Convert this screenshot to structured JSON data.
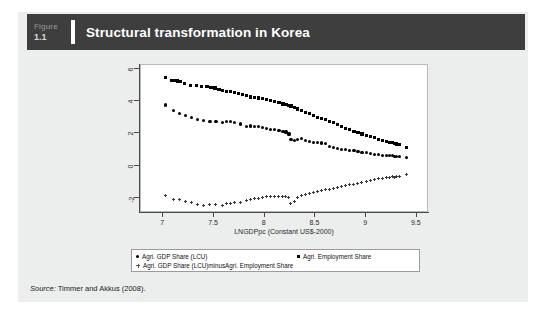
{
  "figure": {
    "label_word": "Figure",
    "number": "1.1",
    "title": "Structural transformation in Korea"
  },
  "source": {
    "prefix": "Source:",
    "text": " Timmer and Akkus (2008)."
  },
  "legend": {
    "items": [
      {
        "marker": "circle",
        "label": "Agri. GDP Share (LCU)"
      },
      {
        "marker": "square",
        "label": "Agri. Employment Share"
      },
      {
        "marker": "plus",
        "label": "Agri. GDP Share (LCU)minusAgri. Employment Share"
      }
    ]
  },
  "chart_data": {
    "type": "scatter",
    "title": "Structural transformation in Korea",
    "xlabel": "LNGDPpc (Constant US$-2000)",
    "ylabel": "",
    "xlim": [
      6.78,
      9.62
    ],
    "ylim": [
      -2.95,
      6.25
    ],
    "xticks": [
      7,
      7.5,
      8,
      8.5,
      9,
      9.5
    ],
    "xtick_labels": [
      "7",
      "7.5",
      "8",
      "8.5",
      "9",
      "9.5"
    ],
    "yticks": [
      6,
      4,
      2,
      0,
      -2
    ],
    "ytick_labels": [
      "6",
      "4",
      "2",
      "0",
      "-2"
    ],
    "grid": false,
    "legend_position": "below-axes",
    "series": [
      {
        "name": "Agri. Employment Share",
        "marker": "square",
        "color": "#000000",
        "points": [
          [
            7.02,
            5.48
          ],
          [
            7.08,
            5.3
          ],
          [
            7.11,
            5.28
          ],
          [
            7.14,
            5.25
          ],
          [
            7.17,
            5.22
          ],
          [
            7.21,
            5.12
          ],
          [
            7.27,
            5.0
          ],
          [
            7.33,
            4.96
          ],
          [
            7.38,
            4.92
          ],
          [
            7.43,
            4.9
          ],
          [
            7.47,
            4.86
          ],
          [
            7.51,
            4.82
          ],
          [
            7.55,
            4.72
          ],
          [
            7.58,
            4.66
          ],
          [
            7.62,
            4.6
          ],
          [
            7.66,
            4.58
          ],
          [
            7.7,
            4.52
          ],
          [
            7.74,
            4.46
          ],
          [
            7.78,
            4.4
          ],
          [
            7.82,
            4.34
          ],
          [
            7.86,
            4.26
          ],
          [
            7.9,
            4.22
          ],
          [
            7.94,
            4.2
          ],
          [
            7.98,
            4.18
          ],
          [
            8.02,
            4.1
          ],
          [
            8.06,
            4.04
          ],
          [
            8.1,
            3.98
          ],
          [
            8.14,
            3.9
          ],
          [
            8.18,
            3.82
          ],
          [
            8.21,
            3.78
          ],
          [
            8.24,
            3.74
          ],
          [
            8.26,
            3.7
          ],
          [
            8.29,
            3.62
          ],
          [
            8.32,
            3.52
          ],
          [
            8.36,
            3.42
          ],
          [
            8.4,
            3.32
          ],
          [
            8.44,
            3.22
          ],
          [
            8.48,
            3.1
          ],
          [
            8.52,
            3.0
          ],
          [
            8.56,
            2.92
          ],
          [
            8.6,
            2.86
          ],
          [
            8.64,
            2.76
          ],
          [
            8.68,
            2.66
          ],
          [
            8.72,
            2.54
          ],
          [
            8.76,
            2.44
          ],
          [
            8.8,
            2.32
          ],
          [
            8.84,
            2.24
          ],
          [
            8.88,
            2.14
          ],
          [
            8.92,
            2.04
          ],
          [
            8.96,
            1.96
          ],
          [
            9.0,
            1.86
          ],
          [
            9.04,
            1.8
          ],
          [
            9.08,
            1.72
          ],
          [
            9.12,
            1.64
          ],
          [
            9.16,
            1.56
          ],
          [
            9.2,
            1.48
          ],
          [
            9.23,
            1.44
          ],
          [
            9.26,
            1.42
          ],
          [
            9.28,
            1.38
          ],
          [
            9.3,
            1.34
          ],
          [
            9.33,
            1.3
          ],
          [
            9.4,
            1.1
          ]
        ]
      },
      {
        "name": "Agri. GDP Share (LCU)",
        "marker": "circle",
        "color": "#000000",
        "points": [
          [
            7.02,
            3.76
          ],
          [
            7.1,
            3.4
          ],
          [
            7.16,
            3.26
          ],
          [
            7.22,
            3.12
          ],
          [
            7.28,
            3.0
          ],
          [
            7.34,
            2.86
          ],
          [
            7.4,
            2.78
          ],
          [
            7.46,
            2.76
          ],
          [
            7.52,
            2.74
          ],
          [
            7.58,
            2.7
          ],
          [
            7.62,
            2.72
          ],
          [
            7.66,
            2.72
          ],
          [
            7.7,
            2.7
          ],
          [
            7.76,
            2.58
          ],
          [
            7.82,
            2.44
          ],
          [
            7.86,
            2.46
          ],
          [
            7.9,
            2.44
          ],
          [
            7.94,
            2.42
          ],
          [
            7.98,
            2.36
          ],
          [
            8.02,
            2.3
          ],
          [
            8.06,
            2.26
          ],
          [
            8.1,
            2.22
          ],
          [
            8.14,
            2.2
          ],
          [
            8.18,
            2.14
          ],
          [
            8.21,
            2.08
          ],
          [
            8.24,
            1.96
          ],
          [
            8.26,
            1.6
          ],
          [
            8.29,
            1.56
          ],
          [
            8.32,
            1.64
          ],
          [
            8.36,
            1.68
          ],
          [
            8.4,
            1.56
          ],
          [
            8.44,
            1.48
          ],
          [
            8.48,
            1.44
          ],
          [
            8.52,
            1.42
          ],
          [
            8.56,
            1.4
          ],
          [
            8.6,
            1.36
          ],
          [
            8.64,
            1.2
          ],
          [
            8.68,
            1.12
          ],
          [
            8.72,
            1.06
          ],
          [
            8.76,
            1.02
          ],
          [
            8.8,
            0.98
          ],
          [
            8.84,
            0.96
          ],
          [
            8.88,
            0.92
          ],
          [
            8.92,
            0.86
          ],
          [
            8.96,
            0.82
          ],
          [
            9.0,
            0.8
          ],
          [
            9.04,
            0.74
          ],
          [
            9.08,
            0.7
          ],
          [
            9.12,
            0.68
          ],
          [
            9.16,
            0.64
          ],
          [
            9.2,
            0.62
          ],
          [
            9.23,
            0.6
          ],
          [
            9.26,
            0.62
          ],
          [
            9.28,
            0.58
          ],
          [
            9.3,
            0.56
          ],
          [
            9.33,
            0.54
          ],
          [
            9.4,
            0.5
          ]
        ]
      },
      {
        "name": "Agri. GDP Share (LCU)minusAgri. Employment Share",
        "marker": "plus",
        "color": "#3a3a3a",
        "points": [
          [
            7.02,
            -1.86
          ],
          [
            7.1,
            -2.1
          ],
          [
            7.16,
            -2.12
          ],
          [
            7.22,
            -2.22
          ],
          [
            7.28,
            -2.32
          ],
          [
            7.34,
            -2.42
          ],
          [
            7.4,
            -2.46
          ],
          [
            7.46,
            -2.42
          ],
          [
            7.52,
            -2.44
          ],
          [
            7.58,
            -2.5
          ],
          [
            7.62,
            -2.38
          ],
          [
            7.66,
            -2.36
          ],
          [
            7.7,
            -2.3
          ],
          [
            7.76,
            -2.28
          ],
          [
            7.82,
            -2.2
          ],
          [
            7.86,
            -2.12
          ],
          [
            7.9,
            -2.04
          ],
          [
            7.94,
            -2.06
          ],
          [
            7.98,
            -2.02
          ],
          [
            8.02,
            -1.96
          ],
          [
            8.06,
            -1.92
          ],
          [
            8.1,
            -1.9
          ],
          [
            8.14,
            -1.94
          ],
          [
            8.18,
            -1.96
          ],
          [
            8.21,
            -1.92
          ],
          [
            8.24,
            -1.98
          ],
          [
            8.26,
            -2.34
          ],
          [
            8.29,
            -2.26
          ],
          [
            8.32,
            -1.98
          ],
          [
            8.36,
            -1.88
          ],
          [
            8.4,
            -1.82
          ],
          [
            8.44,
            -1.76
          ],
          [
            8.48,
            -1.7
          ],
          [
            8.52,
            -1.64
          ],
          [
            8.56,
            -1.58
          ],
          [
            8.6,
            -1.52
          ],
          [
            8.64,
            -1.5
          ],
          [
            8.68,
            -1.44
          ],
          [
            8.72,
            -1.38
          ],
          [
            8.76,
            -1.32
          ],
          [
            8.8,
            -1.26
          ],
          [
            8.84,
            -1.2
          ],
          [
            8.88,
            -1.16
          ],
          [
            8.92,
            -1.12
          ],
          [
            8.96,
            -1.06
          ],
          [
            9.0,
            -1.0
          ],
          [
            9.04,
            -0.96
          ],
          [
            9.08,
            -0.9
          ],
          [
            9.12,
            -0.84
          ],
          [
            9.16,
            -0.8
          ],
          [
            9.2,
            -0.76
          ],
          [
            9.23,
            -0.72
          ],
          [
            9.26,
            -0.7
          ],
          [
            9.28,
            -0.72
          ],
          [
            9.3,
            -0.68
          ],
          [
            9.33,
            -0.66
          ],
          [
            9.4,
            -0.58
          ]
        ]
      }
    ]
  }
}
